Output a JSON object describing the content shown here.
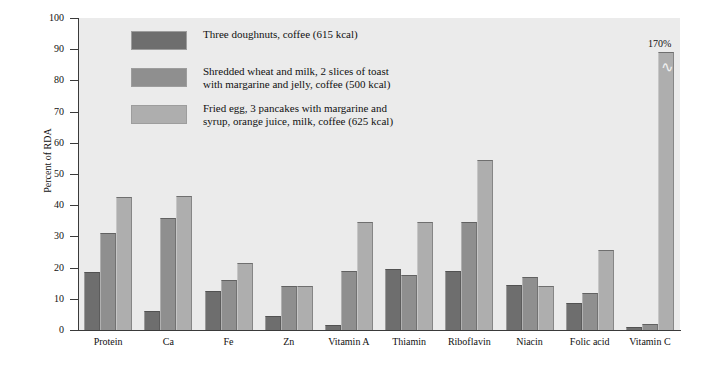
{
  "chart_data": {
    "type": "bar",
    "title": "",
    "xlabel": "",
    "ylabel": "Percent of RDA",
    "ylim": [
      0,
      100
    ],
    "yticks": [
      0,
      10,
      20,
      30,
      40,
      50,
      60,
      70,
      80,
      90,
      100
    ],
    "grid": false,
    "legend_position": "top-center",
    "categories": [
      "Protein",
      "Ca",
      "Fe",
      "Zn",
      "Vitamin A",
      "Thiamin",
      "Riboflavin",
      "Niacin",
      "Folic acid",
      "Vitamin C"
    ],
    "series": [
      {
        "name": "Three doughnuts, coffee (615 kcal)",
        "color": "#6e6e6e",
        "values": [
          18.5,
          6,
          12.5,
          4.5,
          1.5,
          19.5,
          19,
          14.5,
          8.5,
          1
        ]
      },
      {
        "name": "Shredded wheat and milk, 2 slices of toast\nwith margarine and jelly, coffee (500 kcal)",
        "color": "#8f8f8f",
        "values": [
          31,
          36,
          16,
          14,
          19,
          17.5,
          34.5,
          17,
          12,
          2
        ]
      },
      {
        "name": "Fried egg, 3 pancakes with margarine and\nsyrup, orange juice, milk, coffee (625 kcal)",
        "color": "#aeaeae",
        "values": [
          42.5,
          43,
          21.5,
          14,
          34.5,
          34.5,
          54.5,
          14,
          25.5,
          170
        ]
      }
    ],
    "annotations": [
      {
        "label": "170%",
        "category": "Vitamin C",
        "series": "Fried egg, 3 pancakes with margarine and\nsyrup, orange juice, milk, coffee (625 kcal)",
        "note": "bar is truncated with an axis-break symbol; true value 170%"
      }
    ]
  },
  "legend": {
    "items": [
      {
        "label": "Three doughnuts, coffee (615 kcal)"
      },
      {
        "label": "Shredded wheat and milk, 2 slices of toast\nwith margarine and jelly, coffee (500 kcal)"
      },
      {
        "label": "Fried egg, 3 pancakes with margarine and\nsyrup, orange juice, milk, coffee (625 kcal)"
      }
    ]
  },
  "colors": {
    "plot_background": "#ebebeb",
    "page_background": "#ffffff",
    "axis": "#3a3a3a",
    "series_1": "#6e6e6e",
    "series_2": "#8f8f8f",
    "series_3": "#aeaeae"
  }
}
